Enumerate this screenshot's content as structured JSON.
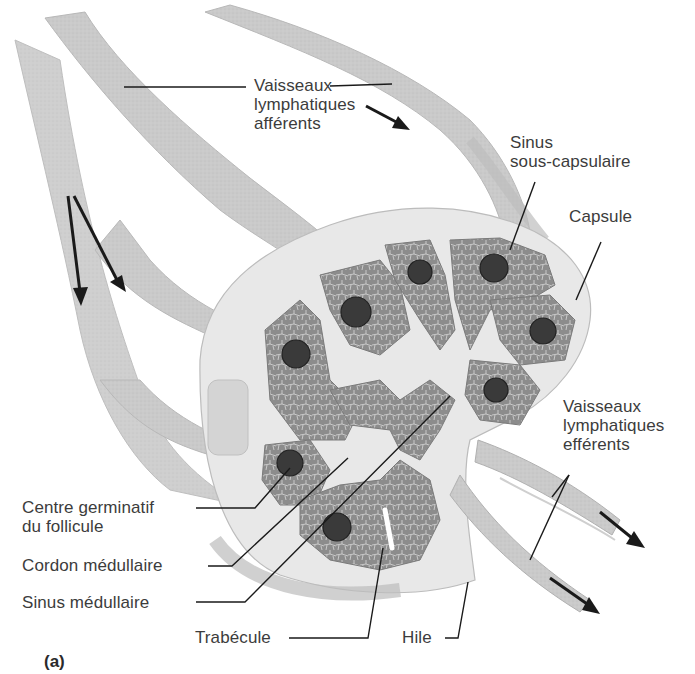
{
  "figure": {
    "panel_label": "(a)",
    "colors": {
      "background": "#ffffff",
      "vessel_fill": "#c9c9c9",
      "vessel_edge": "#b0b0b0",
      "capsule_fill": "#e9e9e9",
      "cortex_fill": "#8f8f8f",
      "cortex_cell_lines": "#d6d6d6",
      "follicle_fill": "#3c3c3c",
      "leader_line": "#1a1a1a",
      "arrow": "#1a1a1a",
      "label_text": "#3c3c3c"
    }
  },
  "labels": {
    "afferent": {
      "lines": [
        "Vaisseaux",
        "lymphatiques",
        "afférents"
      ]
    },
    "subcapsular_sinus": {
      "lines": [
        "Sinus",
        "sous-capsulaire"
      ]
    },
    "capsule": {
      "lines": [
        "Capsule"
      ]
    },
    "efferent": {
      "lines": [
        "Vaisseaux",
        "lymphatiques",
        "efférents"
      ]
    },
    "germinal_center": {
      "lines": [
        "Centre germinatif",
        "du follicule"
      ]
    },
    "medullary_cord": {
      "lines": [
        "Cordon médullaire"
      ]
    },
    "medullary_sinus": {
      "lines": [
        "Sinus médullaire"
      ]
    },
    "trabecula": {
      "lines": [
        "Trabécule"
      ]
    },
    "hilum": {
      "lines": [
        "Hile"
      ]
    }
  },
  "arrows": [
    {
      "name": "afferent-flow-arrow-top",
      "direction": "down-right"
    },
    {
      "name": "afferent-flow-arrow-left-1",
      "direction": "down"
    },
    {
      "name": "afferent-flow-arrow-left-2",
      "direction": "down-right"
    },
    {
      "name": "efferent-flow-arrow-upper",
      "direction": "down-right"
    },
    {
      "name": "efferent-flow-arrow-lower",
      "direction": "down-right"
    }
  ]
}
